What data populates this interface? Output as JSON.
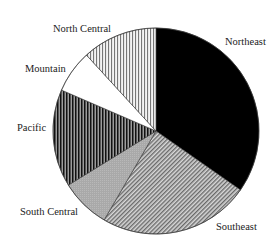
{
  "chart_data": {
    "type": "pie",
    "title": "",
    "start_angle_deg": 0,
    "direction": "clockwise",
    "center": [
      156,
      131
    ],
    "radius": 103,
    "unit": "percent",
    "slices": [
      {
        "label": "Northeast",
        "value": 34.7,
        "fill": "solid-black",
        "color": "#000000"
      },
      {
        "label": "Southeast",
        "value": 23.7,
        "fill": "diagonal-hatch",
        "color": "#9a9a9a"
      },
      {
        "label": "South Central",
        "value": 7.8,
        "fill": "gray",
        "color": "#aaaaaa"
      },
      {
        "label": "Pacific",
        "value": 15.3,
        "fill": "dense-vertical",
        "color": "#2a2a2a"
      },
      {
        "label": "Mountain",
        "value": 6.7,
        "fill": "white",
        "color": "#ffffff"
      },
      {
        "label": "North Central",
        "value": 11.8,
        "fill": "light-vertical",
        "color": "#b0b0b0"
      }
    ],
    "labels_position": [
      {
        "label": "Northeast",
        "x": 225,
        "y": 45
      },
      {
        "label": "Southeast",
        "x": 216,
        "y": 230
      },
      {
        "label": "South Central",
        "x": 20,
        "y": 215
      },
      {
        "label": "Pacific",
        "x": 17,
        "y": 131
      },
      {
        "label": "Mountain",
        "x": 25,
        "y": 72
      },
      {
        "label": "North Central",
        "x": 53,
        "y": 32
      }
    ],
    "legend": null,
    "grid": false
  }
}
